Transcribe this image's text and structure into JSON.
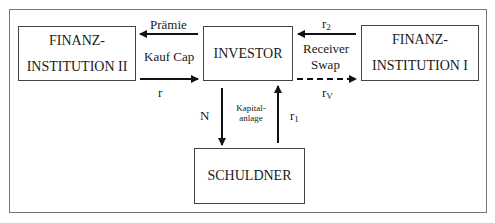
{
  "diagram": {
    "type": "flow",
    "nodes": {
      "fi2": {
        "line1": "FINANZ-",
        "line2": "INSTITUTION II"
      },
      "investor": {
        "label": "INVESTOR"
      },
      "fi1": {
        "line1": "FINANZ-",
        "line2": "INSTITUTION I"
      },
      "schuldner": {
        "label": "SCHULDNER"
      }
    },
    "edges": {
      "investor_to_fi2": {
        "label": "Prämie",
        "style": "solid"
      },
      "fi2_investor_middle": {
        "label": "Kauf Cap"
      },
      "fi2_to_investor": {
        "label": "r",
        "style": "solid"
      },
      "fi1_to_investor": {
        "label_base": "r",
        "label_sub": "2",
        "style": "solid"
      },
      "fi1_investor_middle": {
        "line1": "Receiver",
        "line2": "Swap"
      },
      "investor_to_fi1": {
        "label_base": "r",
        "label_sub": "V",
        "style": "dashed"
      },
      "investor_to_schuldner": {
        "label": "N",
        "style": "solid"
      },
      "schuldner_middle": {
        "line1": "Kapital-",
        "line2": "anlage"
      },
      "schuldner_to_investor": {
        "label_base": "r",
        "label_sub": "1",
        "style": "solid"
      }
    }
  }
}
